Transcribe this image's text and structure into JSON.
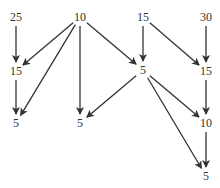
{
  "diagram": {
    "type": "directed-graph",
    "nodes": [
      {
        "id": "n1",
        "label": "25",
        "x": 16,
        "y": 17
      },
      {
        "id": "n2",
        "label": "10",
        "x": 80,
        "y": 17
      },
      {
        "id": "n3",
        "label": "15",
        "x": 143,
        "y": 17
      },
      {
        "id": "n4",
        "label": "30",
        "x": 206,
        "y": 17
      },
      {
        "id": "n5",
        "label": "15",
        "x": 16,
        "y": 71
      },
      {
        "id": "n6",
        "label": "5",
        "x": 143,
        "y": 70
      },
      {
        "id": "n7",
        "label": "15",
        "x": 206,
        "y": 71
      },
      {
        "id": "n8",
        "label": "5",
        "x": 16,
        "y": 123
      },
      {
        "id": "n9",
        "label": "5",
        "x": 80,
        "y": 123
      },
      {
        "id": "n10",
        "label": "10",
        "x": 206,
        "y": 123
      },
      {
        "id": "n11",
        "label": "5",
        "x": 206,
        "y": 176
      }
    ],
    "edges": [
      [
        "n1",
        "n5"
      ],
      [
        "n2",
        "n5"
      ],
      [
        "n2",
        "n8"
      ],
      [
        "n2",
        "n9"
      ],
      [
        "n2",
        "n6"
      ],
      [
        "n3",
        "n6"
      ],
      [
        "n3",
        "n7"
      ],
      [
        "n4",
        "n7"
      ],
      [
        "n5",
        "n8"
      ],
      [
        "n6",
        "n9"
      ],
      [
        "n6",
        "n10"
      ],
      [
        "n6",
        "n11"
      ],
      [
        "n7",
        "n10"
      ],
      [
        "n10",
        "n11"
      ]
    ],
    "edge_color": "#333333"
  }
}
